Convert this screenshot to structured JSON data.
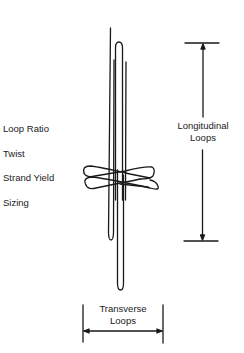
{
  "diagram": {
    "properties": [
      {
        "label": "Loop Ratio"
      },
      {
        "label": "Twist"
      },
      {
        "label": "Strand Yield"
      },
      {
        "label": "Sizing"
      }
    ],
    "dimensions": {
      "longitudinal": {
        "line1": "Longitudinal",
        "line2": "Loops"
      },
      "transverse": {
        "line1": "Transverse",
        "line2": "Loops"
      }
    },
    "colors": {
      "stroke": "#1a1a1a",
      "background": "#ffffff"
    }
  }
}
